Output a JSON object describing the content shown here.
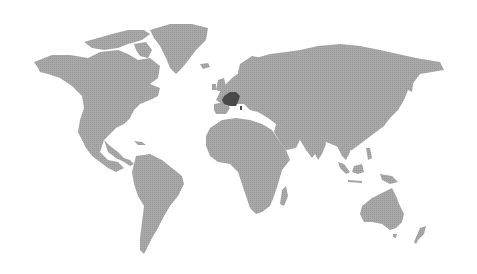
{
  "map": {
    "type": "world-choropleth",
    "projection": "miller-like",
    "background_color": "#ffffff",
    "land_color": "#a3a3a3",
    "highlight_color": "#4a4a4a",
    "highlighted_regions": [
      {
        "name": "France",
        "color": "#4a4a4a"
      }
    ]
  }
}
